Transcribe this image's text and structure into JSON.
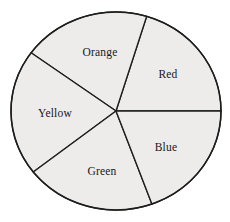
{
  "chart_data": {
    "type": "pie",
    "title": "",
    "subtitle": "",
    "xlabel": "",
    "ylabel": "",
    "grid": false,
    "legend": "none",
    "labels_position": "inside-slice",
    "categories": [
      "Red",
      "Blue",
      "Green",
      "Yellow",
      "Orange"
    ],
    "values": [
      73,
      70,
      72,
      74,
      71
    ],
    "value_units": "degrees",
    "total_degrees": 360,
    "start_angle_deg": 0,
    "direction": "counterclockwise",
    "slices": [
      {
        "label": "Red",
        "angle_deg": 73,
        "start_deg": 0,
        "end_deg": 73,
        "fraction": 0.2028,
        "fill": "#edecea",
        "stroke": "#1d1d1b",
        "label_x": 168,
        "label_y": 74
      },
      {
        "label": "Orange",
        "angle_deg": 71,
        "start_deg": 73,
        "end_deg": 144,
        "fraction": 0.1972,
        "fill": "#edecea",
        "stroke": "#1d1d1b",
        "label_x": 100,
        "label_y": 52
      },
      {
        "label": "Yellow",
        "angle_deg": 74,
        "start_deg": 144,
        "end_deg": 218,
        "fraction": 0.2056,
        "fill": "#edecea",
        "stroke": "#1d1d1b",
        "label_x": 55,
        "label_y": 113
      },
      {
        "label": "Green",
        "angle_deg": 72,
        "start_deg": 218,
        "end_deg": 290,
        "fraction": 0.2,
        "fill": "#edecea",
        "stroke": "#1d1d1b",
        "label_x": 102,
        "label_y": 171
      },
      {
        "label": "Blue",
        "angle_deg": 70,
        "start_deg": 290,
        "end_deg": 360,
        "fraction": 0.1944,
        "fill": "#edecea",
        "stroke": "#1d1d1b",
        "label_x": 166,
        "label_y": 147
      }
    ],
    "geometry": {
      "center_x": 116,
      "center_y": 111,
      "radius": 105,
      "radius_y": 99
    },
    "style": {
      "background": "#ffffff",
      "slice_fill": "#edecea",
      "outline": "#1d1d1b",
      "label_color": "#17171a"
    }
  }
}
